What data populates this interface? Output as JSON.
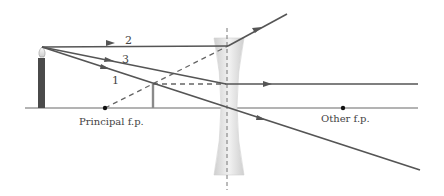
{
  "diagram": {
    "type": "diverging-lens-ray-diagram",
    "labels": {
      "principal_fp": "Principal f.p.",
      "other_fp": "Other f.p.",
      "ray1": "1",
      "ray2": "2",
      "ray3": "3"
    },
    "colors": {
      "ray": "#555555",
      "axis": "#999999",
      "lens": "#d9d9d9",
      "candle": "#4a4a4a",
      "dashed": "#666666"
    }
  }
}
